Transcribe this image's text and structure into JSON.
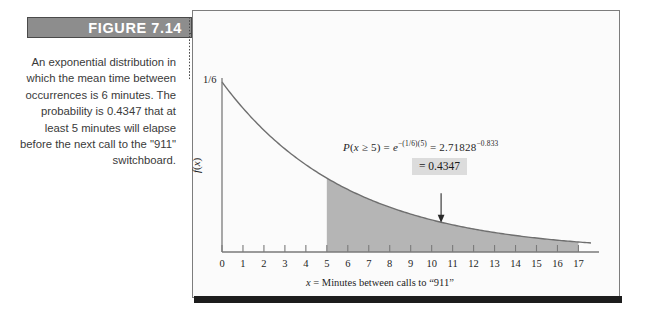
{
  "figure": {
    "banner_label": "FIGURE 7.14",
    "banner_color": "#8d8d8d",
    "banner_text_color": "#ffffff"
  },
  "caption": {
    "text": "An exponential distribution in which the mean time between occurrences is 6 minutes. The probability is 0.4347 that at least 5 minutes will elapse before the next call to the \"911\" switchboard."
  },
  "annotations": {
    "formula_line1_plain": "P(x ≥ 5) = e−(1/6)(5) = 2.71828−0.833",
    "result_label": "= 0.4347",
    "result_box_color": "#dcdcdc"
  },
  "chart_data": {
    "type": "area",
    "title": "",
    "subtitle": "",
    "xlabel": "x = Minutes between calls to \"911\"",
    "ylabel": "f(x)",
    "xlim": [
      0,
      17.6
    ],
    "ylim": [
      0,
      0.1667
    ],
    "grid": false,
    "legend": "none",
    "curve_label": "f(x) = (1/6)e^(-x/6)",
    "y_tick_labels": [
      "1/6"
    ],
    "y_tick_values": [
      0.16667
    ],
    "x_tick_labels": [
      "0",
      "1",
      "2",
      "3",
      "4",
      "5",
      "6",
      "7",
      "8",
      "9",
      "10",
      "11",
      "12",
      "13",
      "14",
      "15",
      "16",
      "17"
    ],
    "x_tick_values": [
      0,
      1,
      2,
      3,
      4,
      5,
      6,
      7,
      8,
      9,
      10,
      11,
      12,
      13,
      14,
      15,
      16,
      17
    ],
    "mean": 6,
    "rate": 0.16667,
    "shaded_region": {
      "from": 5,
      "to": 17,
      "color": "#b5b5b5",
      "probability": 0.4347
    },
    "curve_color": "#6f6f6f",
    "x": [
      0,
      0.5,
      1,
      1.5,
      2,
      2.5,
      3,
      3.5,
      4,
      4.5,
      5,
      5.5,
      6,
      6.5,
      7,
      7.5,
      8,
      8.5,
      9,
      9.5,
      10,
      10.5,
      11,
      11.5,
      12,
      12.5,
      13,
      13.5,
      14,
      14.5,
      15,
      15.5,
      16,
      16.5,
      17
    ],
    "y": [
      0.16667,
      0.15336,
      0.14112,
      0.12985,
      0.11948,
      0.10993,
      0.10115,
      0.09307,
      0.08563,
      0.07879,
      0.07249,
      0.0667,
      0.06137,
      0.05647,
      0.05195,
      0.0478,
      0.04398,
      0.04047,
      0.03723,
      0.03426,
      0.03152,
      0.029,
      0.02668,
      0.02455,
      0.02259,
      0.02078,
      0.01912,
      0.0176,
      0.01619,
      0.0149,
      0.01371,
      0.01261,
      0.0116,
      0.01068,
      0.00982
    ],
    "arrow": {
      "from_x": 10.45,
      "from_y": 0.0575,
      "to_x": 10.45,
      "to_y": 0.0296,
      "color": "#2a2a2a"
    }
  }
}
